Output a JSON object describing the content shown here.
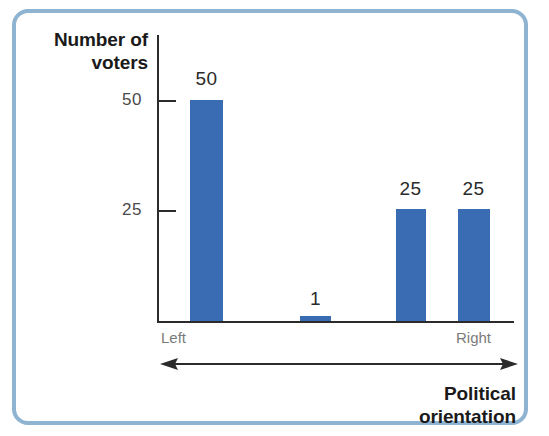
{
  "frame": {
    "border_color": "#8fb4d1",
    "background": "#ffffff"
  },
  "chart_data": {
    "type": "bar",
    "title": "",
    "categories": [
      "Left",
      "",
      "",
      "Right"
    ],
    "values": [
      50,
      1,
      25,
      25
    ],
    "value_labels": [
      "50",
      "1",
      "25",
      "25"
    ],
    "series": [
      {
        "name": "Number of voters",
        "values": [
          50,
          1,
          25,
          25
        ]
      }
    ],
    "ylabel": "Number of\nvoters",
    "ylabel_line1": "Number of",
    "ylabel_line2": "voters",
    "xlabel": "Political orientation",
    "xlabel_line1": "Political",
    "xlabel_line2": "orientation",
    "ylim": [
      0,
      57
    ],
    "ytick_values": [
      25,
      50
    ],
    "ytick_labels": [
      "25",
      "50"
    ],
    "x_axis_endpoints": {
      "left": "Left",
      "right": "Right"
    },
    "grid": false,
    "legend": false,
    "bar_color": "#3a6cb4",
    "axis_color": "#2b2b2b",
    "tick_label_color": "#4a4a4a",
    "category_label_color": "#7b7b7b",
    "arrow": {
      "style": "double-headed",
      "color": "#2b2b2b"
    }
  },
  "bars": [
    {
      "label": "50",
      "value": 50,
      "left": 190,
      "width": 33,
      "top": 100,
      "height": 221,
      "label_left": 184,
      "label_top": 68,
      "label_width": 45
    },
    {
      "label": "1",
      "value": 1,
      "left": 300,
      "width": 31,
      "top": 316,
      "height": 5,
      "label_left": 293,
      "label_top": 288,
      "label_width": 45
    },
    {
      "label": "25",
      "value": 25,
      "left": 396,
      "width": 30,
      "top": 209,
      "height": 112,
      "label_left": 388,
      "label_top": 178,
      "label_width": 45
    },
    {
      "label": "25",
      "value": 25,
      "left": 458,
      "width": 32,
      "top": 209,
      "height": 112,
      "label_left": 451,
      "label_top": 178,
      "label_width": 45
    }
  ]
}
